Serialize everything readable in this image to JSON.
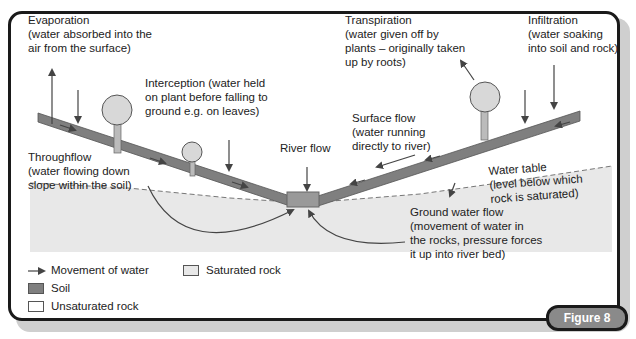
{
  "figure_label": "Figure 8",
  "labels": {
    "evaporation": [
      "Evaporation",
      "(water absorbed into the",
      "air from the surface)"
    ],
    "interception": [
      "Interception (water held",
      "on plant before falling to",
      "ground e.g. on leaves)"
    ],
    "transpiration": [
      "Transpiration",
      "(water given off by",
      "plants – originally taken",
      "up by roots)"
    ],
    "infiltration": [
      "Infiltration",
      "(water soaking",
      "into soil and rock)"
    ],
    "surface_flow": [
      "Surface flow",
      "(water running",
      "directly to river)"
    ],
    "river_flow": [
      "River flow"
    ],
    "throughflow": [
      "Throughflow",
      "(water flowing down",
      "slope within the soil)"
    ],
    "water_table": [
      "Water table",
      "(level below which",
      "rock is saturated)"
    ],
    "ground_water_flow": [
      "Ground water flow",
      "(movement of water in",
      "the rocks, pressure forces",
      "it up into river bed)"
    ]
  },
  "legend": [
    {
      "label": "Movement of water",
      "symbol": "arrow"
    },
    {
      "label": "Saturated rock",
      "color": "#e8e8e8"
    },
    {
      "label": "Soil",
      "color": "#7f7f7f"
    },
    {
      "label": "Unsaturated rock",
      "color": "#ffffff"
    }
  ],
  "colors": {
    "soil": "#7f7f7f",
    "saturated_rock": "#e8e8e8",
    "frame": "#1a1a1a",
    "figure_tab": "#8a8a8a"
  }
}
